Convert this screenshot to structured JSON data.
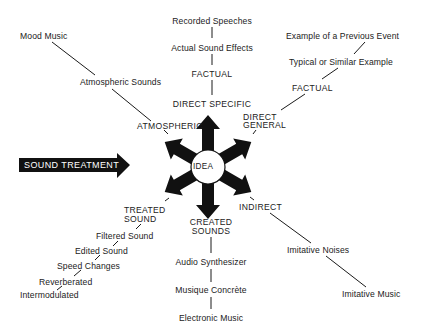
{
  "banner": {
    "label": "SOUND TREATMENT",
    "bg_color": "#111111",
    "text_color": "#ffffff"
  },
  "center": {
    "label": "IDEA"
  },
  "branches": {
    "direct_specific": {
      "label": "DIRECT SPECIFIC",
      "items": [
        "FACTUAL",
        "Actual Sound Effects",
        "Recorded Speeches"
      ]
    },
    "direct_general": {
      "label_line1": "DIRECT",
      "label_line2": "GENERAL",
      "items": [
        "FACTUAL",
        "Typical or Similar Example",
        "Example of a Previous Event"
      ]
    },
    "atmospheric": {
      "label": "ATMOSPHERIC",
      "items": [
        "Atmospheric Sounds",
        "Mood Music"
      ]
    },
    "indirect": {
      "label": "INDIRECT",
      "items": [
        "Imitative Noises",
        "Imitative Music"
      ]
    },
    "treated_sound": {
      "label_line1": "TREATED",
      "label_line2": "SOUND",
      "items": [
        "Filtered Sound",
        "Edited Sound",
        "Speed Changes",
        "Reverberated",
        "Intermodulated"
      ]
    },
    "created_sounds": {
      "label_line1": "CREATED",
      "label_line2": "SOUNDS",
      "items": [
        "Audio Synthesizer",
        "Musique Concrète",
        "Electronic Music"
      ]
    }
  }
}
